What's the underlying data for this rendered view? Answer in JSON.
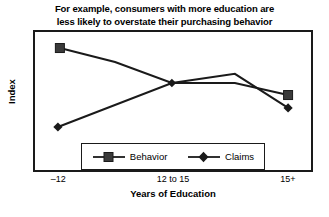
{
  "chart_data": {
    "type": "line",
    "title": "For example, consumers with more education are less likely to overstate their purchasing behavior",
    "title_line1": "For example, consumers with more education are",
    "title_line2": "less likely to overstate their purchasing behavior",
    "xlabel": "Years of Education",
    "ylabel": "Index",
    "categories": [
      "–12",
      "12 to 15",
      "15+"
    ],
    "tick_positions_pct": [
      9,
      50,
      91
    ],
    "grid": false,
    "legend_position": "inside-bottom-center",
    "ylim": [
      0,
      100
    ],
    "axis_tick_marks": false,
    "series": [
      {
        "name": "Behavior",
        "marker": "square",
        "color": "#1a1a1a",
        "values": [
          88,
          61,
          55
        ],
        "points_pct": [
          {
            "x": 9.6,
            "y": 12.7
          },
          {
            "x": 29.3,
            "y": 22.5
          },
          {
            "x": 49.6,
            "y": 37.3
          },
          {
            "x": 72.1,
            "y": 37.3
          },
          {
            "x": 91.1,
            "y": 45.8
          }
        ]
      },
      {
        "name": "Claims",
        "marker": "diamond",
        "color": "#1a1a1a",
        "values": [
          22,
          61,
          42
        ],
        "points_pct": [
          {
            "x": 8.9,
            "y": 68.3
          },
          {
            "x": 49.6,
            "y": 37.3
          },
          {
            "x": 72.1,
            "y": 30.9
          },
          {
            "x": 91.1,
            "y": 54.9
          }
        ]
      }
    ]
  },
  "legend": {
    "items": [
      {
        "label": "Behavior",
        "marker": "square"
      },
      {
        "label": "Claims",
        "marker": "diamond"
      }
    ]
  }
}
